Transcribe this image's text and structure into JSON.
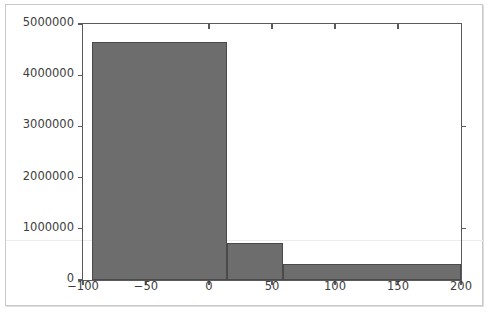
{
  "chart_data": {
    "type": "bar",
    "title": "",
    "subtitle": "",
    "xlabel": "",
    "ylabel": "",
    "grid": false,
    "legend": null,
    "xlim": [
      -100,
      200
    ],
    "ylim": [
      0,
      5000000
    ],
    "xticks": [
      -100,
      -50,
      0,
      50,
      100,
      150,
      200
    ],
    "xtick_labels": [
      "−100",
      "−50",
      "0",
      "50",
      "100",
      "150",
      "200"
    ],
    "yticks": [
      0,
      1000000,
      2000000,
      3000000,
      4000000,
      5000000
    ],
    "ytick_labels": [
      "0",
      "1000000",
      "2000000",
      "3000000",
      "4000000",
      "5000000"
    ],
    "bar_color": "#6d6d6d",
    "bar_edge_color": "#4a4a4a",
    "axis_color": "#5a5a5a",
    "bins": [
      {
        "x0": -93,
        "x1": 14,
        "value": 4650000
      },
      {
        "x0": 14,
        "x1": 59,
        "value": 720000
      },
      {
        "x0": 59,
        "x1": 200,
        "value": 310000
      }
    ],
    "categories": [
      "-93 to 14",
      "14 to 59",
      "59 to 200"
    ],
    "values": [
      4650000,
      720000,
      310000
    ]
  },
  "figure": {
    "background_color": "#ffffff",
    "border_color": "#c9c9c9"
  }
}
